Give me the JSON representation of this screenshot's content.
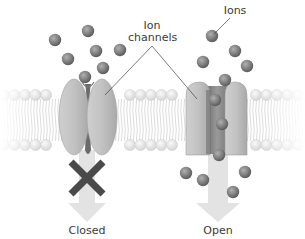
{
  "diagram": {
    "labels": {
      "ion_channels_line1": "Ion",
      "ion_channels_line2": "channels",
      "ions": "Ions",
      "closed": "Closed",
      "open": "Open"
    },
    "colors": {
      "ion": "#8a8a8a",
      "ion_dark": "#5e5e5e",
      "channel": "#bdbdbd",
      "channel_dark": "#8f8f8f",
      "membrane_head": "#e4e4e4",
      "arrow": "#e2e2e2",
      "x_mark": "#4a4a4a",
      "text": "#3a3a3a",
      "leader_line": "#444444"
    },
    "ions_above_closed": [
      {
        "x": 55,
        "y": 40
      },
      {
        "x": 88,
        "y": 31
      },
      {
        "x": 96,
        "y": 51
      },
      {
        "x": 120,
        "y": 50
      },
      {
        "x": 68,
        "y": 59
      },
      {
        "x": 103,
        "y": 68
      },
      {
        "x": 85,
        "y": 77
      }
    ],
    "ions_above_open": [
      {
        "x": 212,
        "y": 36
      },
      {
        "x": 235,
        "y": 51
      },
      {
        "x": 203,
        "y": 62
      },
      {
        "x": 247,
        "y": 66
      },
      {
        "x": 225,
        "y": 80
      }
    ],
    "ions_in_channel": [
      {
        "x": 215,
        "y": 100
      },
      {
        "x": 222,
        "y": 124
      },
      {
        "x": 219,
        "y": 155
      }
    ],
    "ions_below_open": [
      {
        "x": 186,
        "y": 173
      },
      {
        "x": 203,
        "y": 180
      },
      {
        "x": 245,
        "y": 172
      },
      {
        "x": 233,
        "y": 192
      }
    ]
  }
}
